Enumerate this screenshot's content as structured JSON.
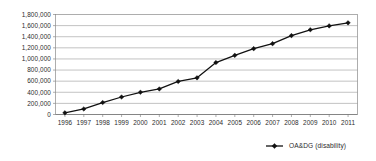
{
  "chart_data": {
    "type": "line",
    "title": "",
    "subtitle": "",
    "xlabel": "",
    "ylabel": "",
    "grid": true,
    "legend_position": "bottom-right",
    "xlim": [
      1996,
      2011
    ],
    "ylim": [
      0,
      1800000
    ],
    "categories": [
      "1996",
      "1997",
      "1998",
      "1999",
      "2000",
      "2001",
      "2002",
      "2003",
      "2004",
      "2005",
      "2006",
      "2007",
      "2008",
      "2009",
      "2010",
      "2011"
    ],
    "ytick_labels": [
      "1,800,000",
      "1,600,000",
      "1,400,000",
      "1,200,000",
      "1,000,000",
      "800,000",
      "600,000",
      "400,000",
      "200,000",
      "0"
    ],
    "ytick_values": [
      1800000,
      1600000,
      1400000,
      1200000,
      1000000,
      800000,
      600000,
      400000,
      200000,
      0
    ],
    "series": [
      {
        "name": "OA&DG (disability)",
        "marker": "diamond",
        "color": "#111111",
        "values": [
          30000,
          100000,
          215000,
          315000,
          400000,
          460000,
          595000,
          660000,
          935000,
          1065000,
          1185000,
          1275000,
          1420000,
          1525000,
          1595000,
          1650000
        ]
      }
    ]
  },
  "legend": {
    "entries": [
      {
        "label": "OA&DG (disability)"
      }
    ]
  }
}
